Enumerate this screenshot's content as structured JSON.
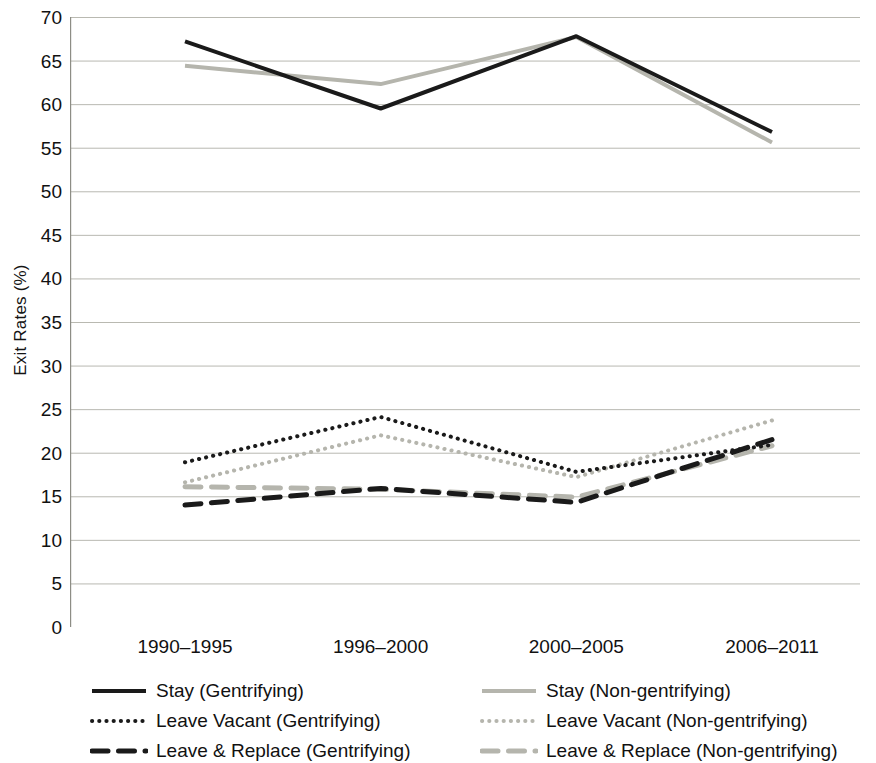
{
  "chart_data": {
    "type": "line",
    "title": "",
    "xlabel": "",
    "ylabel": "Exit Rates (%)",
    "categories": [
      "1990–1995",
      "1996–2000",
      "2000–2005",
      "2006–2011"
    ],
    "ylim": [
      0,
      70
    ],
    "yticks": [
      0,
      5,
      10,
      15,
      20,
      25,
      30,
      35,
      40,
      45,
      50,
      55,
      60,
      65,
      70
    ],
    "grid": true,
    "legend_position": "bottom",
    "series": [
      {
        "name": "Stay (Gentrifying)",
        "values": [
          67.2,
          59.5,
          67.8,
          56.8
        ],
        "color": "#1a1a1a",
        "style": "solid",
        "width": 4
      },
      {
        "name": "Stay (Non-gentrifying)",
        "values": [
          64.4,
          62.3,
          67.7,
          55.6
        ],
        "color": "#b5b5ad",
        "style": "solid",
        "width": 4
      },
      {
        "name": "Leave Vacant (Gentrifying)",
        "values": [
          18.9,
          24.1,
          17.8,
          20.9
        ],
        "color": "#1a1a1a",
        "style": "dotted",
        "width": 4
      },
      {
        "name": "Leave Vacant (Non-gentrifying)",
        "values": [
          16.6,
          22.0,
          17.2,
          23.7
        ],
        "color": "#b5b5ad",
        "style": "dotted",
        "width": 4
      },
      {
        "name": "Leave & Replace (Gentrifying)",
        "values": [
          14.0,
          15.9,
          14.3,
          21.5
        ],
        "color": "#1a1a1a",
        "style": "dashed",
        "width": 5
      },
      {
        "name": "Leave & Replace (Non-gentrifying)",
        "values": [
          16.1,
          15.8,
          14.9,
          20.8
        ],
        "color": "#b5b5ad",
        "style": "dashed",
        "width": 5
      }
    ]
  },
  "axis": {
    "y_title": "Exit Rates (%)",
    "y_tick_labels": [
      "70",
      "65",
      "60",
      "55",
      "50",
      "45",
      "40",
      "35",
      "30",
      "25",
      "20",
      "15",
      "10",
      "5",
      "0"
    ],
    "x_tick_labels": [
      "1990–1995",
      "1996–2000",
      "2000–2005",
      "2006–2011"
    ]
  },
  "legend": {
    "entries": [
      {
        "label": "Stay (Gentrifying)",
        "color": "#1a1a1a",
        "style": "solid"
      },
      {
        "label": "Stay (Non-gentrifying)",
        "color": "#b5b5ad",
        "style": "solid"
      },
      {
        "label": "Leave Vacant (Gentrifying)",
        "color": "#1a1a1a",
        "style": "dotted"
      },
      {
        "label": "Leave Vacant (Non-gentrifying)",
        "color": "#b5b5ad",
        "style": "dotted"
      },
      {
        "label": "Leave & Replace (Gentrifying)",
        "color": "#1a1a1a",
        "style": "dashed"
      },
      {
        "label": "Leave & Replace (Non-gentrifying)",
        "color": "#b5b5ad",
        "style": "dashed"
      }
    ]
  },
  "colors": {
    "gentrifying": "#1a1a1a",
    "non_gentrifying": "#b5b5ad",
    "gridline": "#b9b9b1",
    "axis": "#8d8d85",
    "background": "#ffffff"
  }
}
